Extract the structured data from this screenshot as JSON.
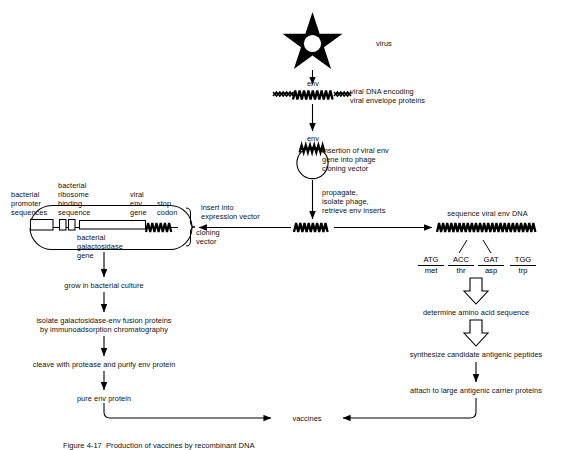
{
  "figure": {
    "caption": "Figure 4-17  Production of vaccines by recombinant DNA"
  },
  "colors": {
    "ink": "#000000",
    "background": "#ffffff"
  },
  "nodes": {
    "virus": {
      "label": "virus",
      "icon": "star-virus-icon"
    },
    "viral_dna": {
      "gene_label": "env",
      "label_line1": "viral DNA encoding",
      "label_line2": "viral envelope proteins",
      "icon": "dna-strand-icon"
    },
    "phage_vector": {
      "gene_label": "env",
      "label_line1": "insertion of viral env",
      "label_line2": "gene into phage",
      "label_line3": "cloning vector",
      "icon": "circular-plasmid-icon"
    },
    "propagate": {
      "line1": "propagate,",
      "line2": "isolate phage,",
      "line3": "retrieve env inserts"
    },
    "env_insert": {
      "icon": "dna-insert-icon"
    },
    "insert_into": {
      "line1": "insert into",
      "line2": "expression vector"
    },
    "expression_vector": {
      "promoter_l1": "bacterial",
      "promoter_l2": "promoter",
      "promoter_l3": "sequences",
      "ribosome_l1": "bacterial",
      "ribosome_l2": "ribosome",
      "ribosome_l3": "binding",
      "ribosome_l4": "sequence",
      "viral_env_l1": "viral",
      "viral_env_l2": "env",
      "viral_env_l3": "gene",
      "stop_l1": "stop",
      "stop_l2": "codon",
      "galactosidase_l1": "bacterial",
      "galactosidase_l2": "galactosidase",
      "galactosidase_l3": "gene",
      "cloning_l1": "cloning",
      "cloning_l2": "vector",
      "icon": "plasmid-map-icon"
    },
    "sequence_dna": {
      "label": "sequence viral env DNA",
      "icon": "dna-sequence-icon"
    }
  },
  "codons": [
    {
      "codon": "ATG",
      "amino_acid": "met"
    },
    {
      "codon": "ACC",
      "amino_acid": "thr"
    },
    {
      "codon": "GAT",
      "amino_acid": "asp"
    },
    {
      "codon": "TGG",
      "amino_acid": "trp"
    }
  ],
  "left_steps": [
    "grow in bacterial culture",
    "isolate galactosidase-env fusion proteins",
    "by immunoadsorption chromatography",
    "cleave with protease and purify env protein",
    "pure env protein"
  ],
  "right_steps": [
    "determine amino acid sequence",
    "synthesize candidate antigenic peptides",
    "attach to large antigenic carrier proteins"
  ],
  "outcome": {
    "label": "vaccines"
  }
}
